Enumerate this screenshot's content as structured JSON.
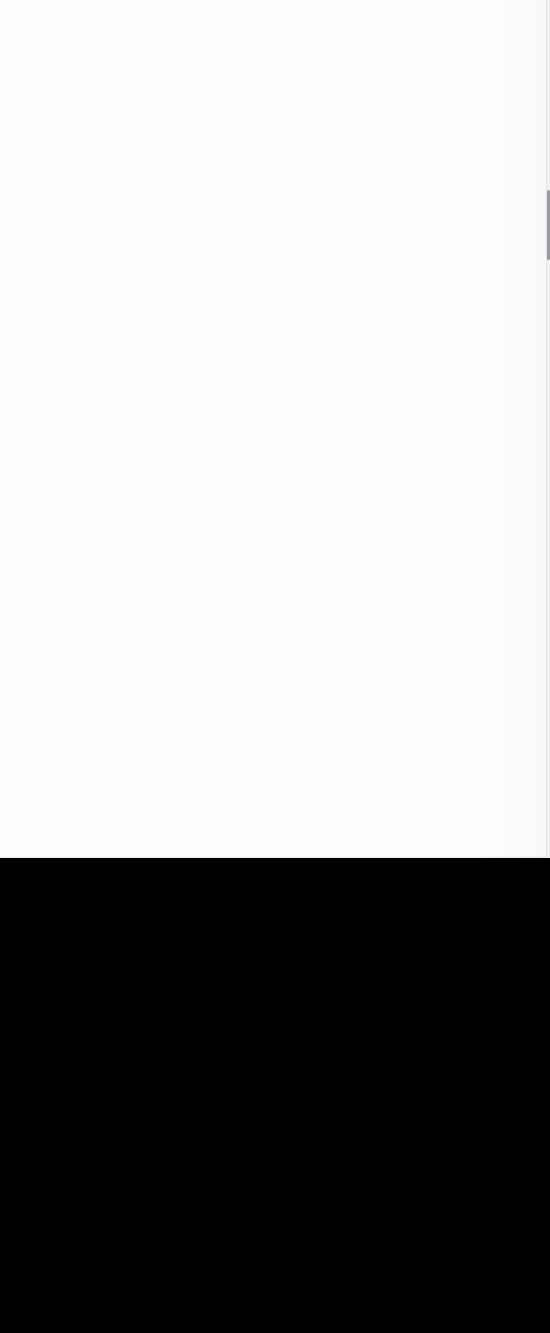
{
  "capture": {
    "width": 550,
    "height": 1333
  },
  "regions": {
    "content_panel": {
      "role": "empty-content-viewport",
      "background_color": "#fdfdfd",
      "x": 0,
      "y": 0,
      "width": 550,
      "height": 858,
      "visible_text": ""
    },
    "lower_fill": {
      "role": "empty-black-area",
      "background_color": "#000000",
      "x": 0,
      "y": 858,
      "width": 550,
      "height": 475,
      "visible_text": ""
    }
  },
  "scrollbar": {
    "orientation": "vertical",
    "track_color": "#f1f1f2",
    "thumb_color": "#9a9a9e",
    "x": 546,
    "width": 4,
    "thumb_offset_y": 190,
    "thumb_height": 70
  },
  "accessibility": {
    "empty_state_note": "Blank viewport — no text, icons, or controls rendered."
  }
}
